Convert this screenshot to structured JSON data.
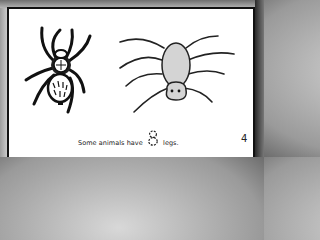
{
  "page": {
    "caption_before": "Some animals have",
    "traced_number": "8",
    "caption_after": "legs.",
    "page_number": "4"
  },
  "illustrations": [
    {
      "name": "realistic-spider",
      "description": "black ink drawing of a hairy spider"
    },
    {
      "name": "cartoon-spider",
      "description": "simple cartoon spider with gray body and 8 legs",
      "body_color": "#d4d4d4"
    }
  ],
  "colors": {
    "card": "#ffffff",
    "border": "#111111",
    "ink": "#222222"
  }
}
